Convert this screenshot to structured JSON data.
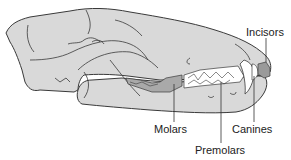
{
  "diagram": {
    "colors": {
      "bone": "#d9d9d9",
      "outline": "#3a3a3a",
      "molars": "#a9a9a9",
      "premolars": "#ffffff",
      "canines": "#ffffff",
      "incisors": "#9a9a9a",
      "leader_line": "#333333",
      "label_text": "#222222"
    },
    "labels": {
      "incisors": "Incisors",
      "molars": "Molars",
      "premolars": "Premolars",
      "canines": "Canines"
    }
  }
}
